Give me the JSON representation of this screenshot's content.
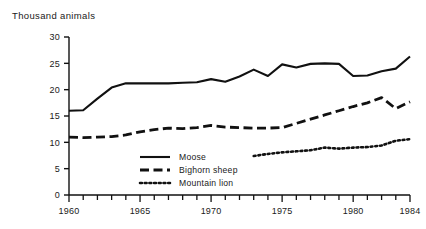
{
  "chart_data": {
    "type": "line",
    "title": "",
    "ylabel": "Thousand animals",
    "xlabel": "",
    "ylim": [
      0,
      30
    ],
    "xlim": [
      1960,
      1984
    ],
    "yticks": [
      0,
      5,
      10,
      15,
      20,
      25,
      30
    ],
    "xticks": [
      1960,
      1965,
      1970,
      1975,
      1980,
      1984
    ],
    "xtick_minor_every": 1,
    "grid": false,
    "legend_position": "inside-bottom-center",
    "x": [
      1960,
      1961,
      1962,
      1963,
      1964,
      1965,
      1966,
      1967,
      1968,
      1969,
      1970,
      1971,
      1972,
      1973,
      1974,
      1975,
      1976,
      1977,
      1978,
      1979,
      1980,
      1981,
      1982,
      1983,
      1984
    ],
    "series": [
      {
        "name": "Moose",
        "style": "solid",
        "x": [
          1960,
          1961,
          1962,
          1963,
          1964,
          1965,
          1966,
          1967,
          1968,
          1969,
          1970,
          1971,
          1972,
          1973,
          1974,
          1975,
          1976,
          1977,
          1978,
          1979,
          1980,
          1981,
          1982,
          1983,
          1984
        ],
        "values": [
          16.0,
          16.1,
          18.3,
          20.4,
          21.2,
          21.2,
          21.2,
          21.2,
          21.3,
          21.4,
          22.0,
          21.5,
          22.5,
          23.8,
          22.6,
          24.8,
          24.2,
          24.9,
          25.0,
          24.9,
          22.6,
          22.7,
          23.5,
          24.0,
          26.3
        ]
      },
      {
        "name": "Bighorn sheep",
        "style": "dashed",
        "x": [
          1960,
          1961,
          1962,
          1963,
          1964,
          1965,
          1966,
          1967,
          1968,
          1969,
          1970,
          1971,
          1972,
          1973,
          1974,
          1975,
          1976,
          1977,
          1978,
          1979,
          1980,
          1981,
          1982,
          1983,
          1984
        ],
        "values": [
          11.0,
          10.9,
          11.0,
          11.1,
          11.4,
          12.0,
          12.4,
          12.7,
          12.6,
          12.8,
          13.2,
          12.9,
          12.8,
          12.7,
          12.7,
          12.8,
          13.6,
          14.4,
          15.2,
          16.0,
          16.8,
          17.5,
          18.5,
          16.4,
          17.7
        ]
      },
      {
        "name": "Mountain lion",
        "style": "dotted",
        "x": [
          1973,
          1974,
          1975,
          1976,
          1977,
          1978,
          1979,
          1980,
          1981,
          1982,
          1983,
          1984
        ],
        "values": [
          7.4,
          7.8,
          8.1,
          8.3,
          8.5,
          9.0,
          8.8,
          9.0,
          9.1,
          9.4,
          10.3,
          10.6
        ]
      }
    ]
  },
  "legend": {
    "items": [
      {
        "label": "Moose",
        "style": "solid"
      },
      {
        "label": "Bighorn sheep",
        "style": "dashed"
      },
      {
        "label": "Mountain lion",
        "style": "dotted"
      }
    ]
  },
  "colors": {
    "ink": "#111111",
    "background": "#ffffff"
  }
}
